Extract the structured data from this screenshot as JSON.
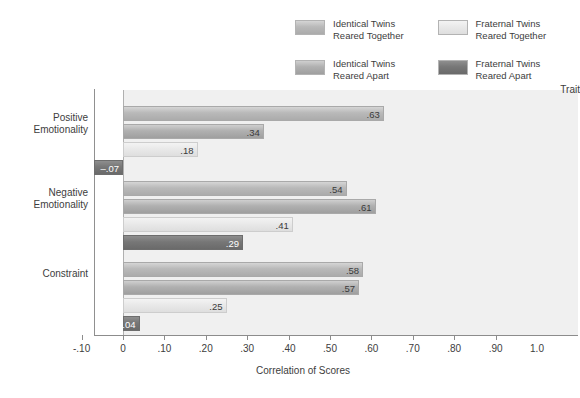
{
  "chart_data": {
    "type": "bar",
    "orientation": "horizontal",
    "title": "",
    "xlabel": "Correlation of Scores",
    "ylabel": "Trait",
    "xlim": [
      -0.1,
      1.0
    ],
    "xticks": [
      "-.10",
      "0",
      ".10",
      ".20",
      ".30",
      ".40",
      ".50",
      ".60",
      ".70",
      ".80",
      ".90",
      "1.0"
    ],
    "xtick_values": [
      -0.1,
      0,
      0.1,
      0.2,
      0.3,
      0.4,
      0.5,
      0.6,
      0.7,
      0.8,
      0.9,
      1.0
    ],
    "grid": false,
    "legend_position": "top-right",
    "categories": [
      "Positive\nEmotionality",
      "Negative\nEmotionality",
      "Constraint"
    ],
    "series": [
      {
        "name": "Identical Twins\nReared Together",
        "key": "itt",
        "color": "#b9b9b9",
        "values": [
          0.63,
          0.54,
          0.58
        ],
        "labels": [
          ".63",
          ".54",
          ".58"
        ]
      },
      {
        "name": "Identical Twins\nReared Apart",
        "key": "ita",
        "color": "#b0b0b0",
        "values": [
          0.34,
          0.61,
          0.57
        ],
        "labels": [
          ".34",
          ".61",
          ".57"
        ]
      },
      {
        "name": "Fraternal Twins\nReared Together",
        "key": "ftt",
        "color": "#e8e8e8",
        "values": [
          0.18,
          0.41,
          0.25
        ],
        "labels": [
          ".18",
          ".41",
          ".25"
        ]
      },
      {
        "name": "Fraternal Twins\nReared Apart",
        "key": "fta",
        "color": "#777777",
        "values": [
          -0.07,
          0.29,
          0.04
        ],
        "labels": [
          "–.07",
          ".29",
          ".04"
        ]
      }
    ]
  },
  "axis": {
    "trait_header": "Trait",
    "x_title": "Correlation of Scores"
  },
  "legend": {
    "items": [
      {
        "label": "Identical Twins\nReared Together",
        "key": "itt"
      },
      {
        "label": "Fraternal Twins\nReared Together",
        "key": "ftt"
      },
      {
        "label": "Identical Twins\nReared Apart",
        "key": "ita"
      },
      {
        "label": "Fraternal Twins\nReared Apart",
        "key": "fta"
      }
    ]
  },
  "groups": [
    {
      "label": "Positive\nEmotionality"
    },
    {
      "label": "Negative\nEmotionality"
    },
    {
      "label": "Constraint"
    }
  ]
}
